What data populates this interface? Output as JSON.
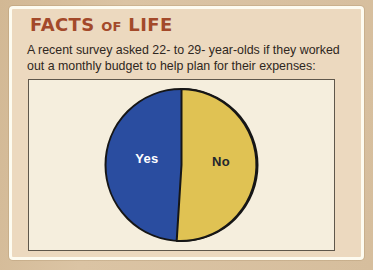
{
  "card": {
    "title": "FACTS OF LIFE",
    "title_parts": [
      "FACTS",
      "OF",
      "LIFE"
    ],
    "description_lines": [
      "A recent survey asked 22- to 29- year-olds if they worked",
      "out a monthly budget to help plan for their expenses:"
    ]
  },
  "chart_data": {
    "type": "pie",
    "title": "",
    "categories": [
      "Yes",
      "No"
    ],
    "values": [
      49,
      51
    ],
    "value_unit": "percent",
    "start_angle_deg": 0,
    "direction": "No slice sweeps clockwise from 12 o'clock",
    "legend": "none",
    "slice_colors": [
      "#2a4da0",
      "#e0c253"
    ],
    "label_colors": [
      "#ffffff",
      "#23272e"
    ],
    "outline_color": "#161616"
  },
  "colors": {
    "page_background": "#d6be9d",
    "card_background": "#ecd9bf",
    "card_border": "#fdfbf0",
    "panel_background": "#f5eedd",
    "panel_border": "#5f574b",
    "title_text": "#a3492a",
    "body_text": "#2f2721"
  }
}
